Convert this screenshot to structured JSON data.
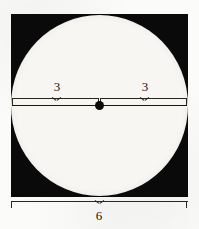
{
  "figure": {
    "background_color": "#fbfbfa",
    "square_color": "#0a0a0a",
    "circle_color": "#f7f6f3",
    "ink_color": "#15120d"
  },
  "labels": {
    "left_radius": "3",
    "right_radius": "3",
    "square_side": "6"
  },
  "chart_data": {
    "type": "diagram",
    "shapes": [
      {
        "name": "square",
        "kind": "square",
        "fill": "#0a0a0a",
        "side_length": 6,
        "side_label": "6"
      },
      {
        "name": "inscribed-circle",
        "kind": "circle",
        "fill": "#f7f6f3",
        "diameter": 6,
        "radius": 3
      }
    ],
    "measurements": [
      {
        "name": "left-radius",
        "value": 3,
        "label": "3",
        "position": "above-diameter-left"
      },
      {
        "name": "right-radius",
        "value": 3,
        "label": "3",
        "position": "above-diameter-right"
      },
      {
        "name": "square-side",
        "value": 6,
        "label": "6",
        "position": "below-square"
      }
    ],
    "annotations": [
      {
        "name": "center-point",
        "kind": "dot",
        "label": ""
      },
      {
        "name": "diameter-line",
        "kind": "line",
        "label": ""
      }
    ]
  }
}
